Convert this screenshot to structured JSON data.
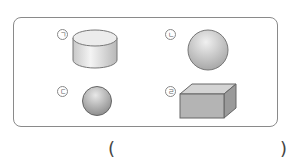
{
  "question": {
    "items": [
      {
        "label": "ㄱ",
        "shape": "cylinder"
      },
      {
        "label": "ㄴ",
        "shape": "sphere"
      },
      {
        "label": "ㄷ",
        "shape": "sphere-small"
      },
      {
        "label": "ㄹ",
        "shape": "cuboid"
      }
    ],
    "answer_open": "(",
    "answer_close": ")"
  }
}
